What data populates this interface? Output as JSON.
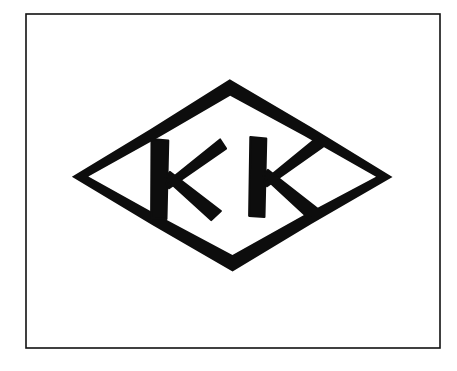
{
  "image": {
    "kind": "scanned-trademark-mark",
    "width": 457,
    "height": 371,
    "background_color": "#ffffff",
    "ink_color": "#0d0d0d"
  },
  "frame": {
    "name": "outer-rectangular-border",
    "x": 26,
    "y": 14,
    "width": 414,
    "height": 334,
    "stroke_width": 1.6,
    "stroke_color": "#111111",
    "fill_color": "#ffffff"
  },
  "mark": {
    "shape": "diamond",
    "shape_label": "lozenge outline",
    "stroke_color": "#0d0d0d",
    "stroke_width": 10,
    "vertices": {
      "left": [
        73,
        177
      ],
      "top": [
        231,
        78
      ],
      "right": [
        394,
        176
      ],
      "bottom": [
        234,
        271
      ]
    }
  },
  "letters": {
    "text": "KK",
    "glyphs": [
      {
        "char": "K",
        "name": "letter-k-left",
        "x": 152,
        "y": 139,
        "width": 74,
        "height": 80
      },
      {
        "char": "K",
        "name": "letter-k-right",
        "x": 250,
        "y": 137,
        "width": 73,
        "height": 80
      }
    ],
    "color": "#0d0d0d",
    "style": "hand-drawn-brush-capital"
  },
  "artifacts": [
    {
      "name": "scan-speck",
      "x": 321,
      "y": 122,
      "radius": 1.6,
      "color": "#ffffff"
    }
  ]
}
